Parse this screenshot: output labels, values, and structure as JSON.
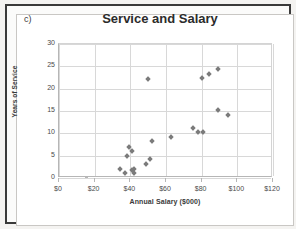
{
  "panel": {
    "label": "c)"
  },
  "chart_data": {
    "type": "scatter",
    "title": "Service and Salary",
    "xlabel": "Annual Salary ($000)",
    "ylabel": "Years of Service",
    "xlim": [
      0,
      120
    ],
    "ylim": [
      0,
      30
    ],
    "xticks": [
      "$0",
      "$20",
      "$40",
      "$60",
      "$80",
      "$100",
      "$120"
    ],
    "xtick_values": [
      0,
      20,
      40,
      60,
      80,
      100,
      120
    ],
    "yticks": [
      "0",
      "5",
      "10",
      "15",
      "20",
      "25",
      "30"
    ],
    "ytick_values": [
      0,
      5,
      10,
      15,
      20,
      25,
      30
    ],
    "grid": true,
    "legend": false,
    "marker": "diamond",
    "marker_color": "#7b7b7b",
    "points": [
      {
        "x": 34,
        "y": 2.0
      },
      {
        "x": 37,
        "y": 1.1
      },
      {
        "x": 38,
        "y": 5.0
      },
      {
        "x": 39,
        "y": 7.0
      },
      {
        "x": 41,
        "y": 6.1
      },
      {
        "x": 41,
        "y": 1.8
      },
      {
        "x": 42,
        "y": 1.1
      },
      {
        "x": 42,
        "y": 2.0
      },
      {
        "x": 49,
        "y": 3.2
      },
      {
        "x": 50,
        "y": 22.2
      },
      {
        "x": 51,
        "y": 4.2
      },
      {
        "x": 52,
        "y": 8.2
      },
      {
        "x": 63,
        "y": 9.2
      },
      {
        "x": 75,
        "y": 11.2
      },
      {
        "x": 78,
        "y": 10.2
      },
      {
        "x": 80,
        "y": 22.3
      },
      {
        "x": 81,
        "y": 10.2
      },
      {
        "x": 84,
        "y": 23.3
      },
      {
        "x": 89,
        "y": 24.3
      },
      {
        "x": 89,
        "y": 15.2
      },
      {
        "x": 95,
        "y": 14.2
      }
    ]
  }
}
